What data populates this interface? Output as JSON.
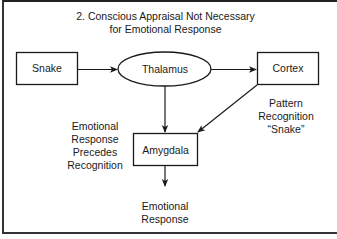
{
  "diagram": {
    "title_line1": "2. Conscious Appraisal Not Necessary",
    "title_line2": "for Emotional Response",
    "nodes": {
      "snake": {
        "label": "Snake",
        "shape": "rectangle"
      },
      "thalamus": {
        "label": "Thalamus",
        "shape": "ellipse"
      },
      "cortex": {
        "label": "Cortex",
        "shape": "rectangle"
      },
      "amygdala": {
        "label": "Amygdala",
        "shape": "rectangle"
      }
    },
    "edges": [
      {
        "from": "snake",
        "to": "thalamus"
      },
      {
        "from": "thalamus",
        "to": "cortex"
      },
      {
        "from": "thalamus",
        "to": "amygdala"
      },
      {
        "from": "cortex",
        "to": "amygdala"
      },
      {
        "from": "amygdala",
        "to": "emotional_response"
      }
    ],
    "annotations": {
      "left_note": [
        "Emotional",
        "Response",
        "Precedes",
        "Recognition"
      ],
      "right_note": [
        "Pattern",
        "Recognition",
        "“Snake”"
      ],
      "output": [
        "Emotional",
        "Response"
      ]
    },
    "colors": {
      "stroke": "#1a1a1a",
      "background": "#ffffff"
    }
  }
}
